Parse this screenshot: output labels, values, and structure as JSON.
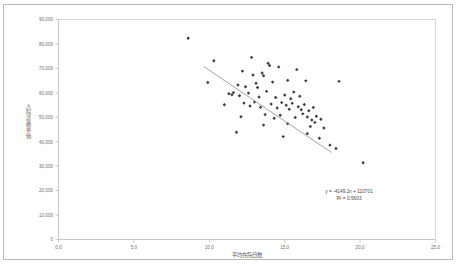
{
  "chart_data": {
    "type": "scatter",
    "title": "",
    "xlabel": "平均在院日数",
    "ylabel": "入院診療単価",
    "xlim": [
      0.0,
      25.0
    ],
    "ylim": [
      0,
      90000
    ],
    "xticks": [
      "0.0",
      "5.0",
      "10.0",
      "15.0",
      "20.0",
      "25.0"
    ],
    "xtick_values": [
      0.0,
      5.0,
      10.0,
      15.0,
      20.0,
      25.0
    ],
    "yticks": [
      "0",
      "10,000",
      "20,000",
      "30,000",
      "40,000",
      "50,000",
      "60,000",
      "70,000",
      "80,000",
      "90,000"
    ],
    "ytick_values": [
      0,
      10000,
      20000,
      30000,
      40000,
      50000,
      60000,
      70000,
      80000,
      90000
    ],
    "grid": false,
    "legend": "none",
    "marker_color": "#3a3a4a",
    "trendline_color": "#8e8e8e",
    "annotations": [
      "y = -4149.2x + 110701",
      "R² = 0.5603"
    ],
    "trendline": {
      "slope": -4149.2,
      "intercept": 110701,
      "r_squared": 0.5603,
      "x_start": 9.6,
      "x_end": 18.1
    },
    "points": [
      {
        "x": 8.6,
        "y": 82300
      },
      {
        "x": 10.3,
        "y": 73100
      },
      {
        "x": 12.8,
        "y": 74500
      },
      {
        "x": 13.9,
        "y": 72100
      },
      {
        "x": 14.0,
        "y": 71200
      },
      {
        "x": 14.6,
        "y": 70600
      },
      {
        "x": 9.9,
        "y": 64200
      },
      {
        "x": 12.2,
        "y": 68900
      },
      {
        "x": 12.9,
        "y": 67300
      },
      {
        "x": 13.5,
        "y": 68100
      },
      {
        "x": 13.6,
        "y": 67000
      },
      {
        "x": 15.8,
        "y": 69500
      },
      {
        "x": 16.4,
        "y": 64900
      },
      {
        "x": 11.9,
        "y": 63200
      },
      {
        "x": 12.4,
        "y": 62500
      },
      {
        "x": 13.1,
        "y": 63900
      },
      {
        "x": 13.2,
        "y": 62200
      },
      {
        "x": 14.2,
        "y": 64400
      },
      {
        "x": 15.2,
        "y": 65100
      },
      {
        "x": 18.6,
        "y": 64700
      },
      {
        "x": 11.3,
        "y": 59600
      },
      {
        "x": 11.5,
        "y": 59200
      },
      {
        "x": 11.6,
        "y": 60100
      },
      {
        "x": 12.0,
        "y": 58800
      },
      {
        "x": 12.6,
        "y": 59900
      },
      {
        "x": 13.3,
        "y": 58300
      },
      {
        "x": 13.8,
        "y": 60600
      },
      {
        "x": 14.4,
        "y": 58100
      },
      {
        "x": 15.0,
        "y": 59100
      },
      {
        "x": 15.4,
        "y": 57600
      },
      {
        "x": 15.6,
        "y": 60300
      },
      {
        "x": 16.0,
        "y": 58600
      },
      {
        "x": 11.0,
        "y": 55100
      },
      {
        "x": 12.3,
        "y": 55800
      },
      {
        "x": 12.7,
        "y": 54600
      },
      {
        "x": 13.0,
        "y": 56200
      },
      {
        "x": 13.4,
        "y": 54100
      },
      {
        "x": 14.1,
        "y": 55400
      },
      {
        "x": 14.5,
        "y": 53800
      },
      {
        "x": 14.8,
        "y": 56000
      },
      {
        "x": 15.1,
        "y": 54900
      },
      {
        "x": 15.3,
        "y": 53300
      },
      {
        "x": 15.5,
        "y": 55700
      },
      {
        "x": 15.9,
        "y": 54300
      },
      {
        "x": 16.1,
        "y": 53100
      },
      {
        "x": 16.3,
        "y": 55200
      },
      {
        "x": 16.6,
        "y": 52700
      },
      {
        "x": 16.9,
        "y": 54000
      },
      {
        "x": 12.1,
        "y": 50200
      },
      {
        "x": 13.7,
        "y": 51100
      },
      {
        "x": 14.3,
        "y": 49600
      },
      {
        "x": 14.7,
        "y": 50800
      },
      {
        "x": 15.7,
        "y": 49900
      },
      {
        "x": 16.2,
        "y": 51400
      },
      {
        "x": 16.5,
        "y": 50100
      },
      {
        "x": 16.8,
        "y": 48900
      },
      {
        "x": 17.1,
        "y": 50400
      },
      {
        "x": 17.4,
        "y": 49200
      },
      {
        "x": 13.6,
        "y": 46800
      },
      {
        "x": 15.2,
        "y": 47400
      },
      {
        "x": 16.7,
        "y": 46200
      },
      {
        "x": 17.0,
        "y": 47900
      },
      {
        "x": 17.6,
        "y": 45600
      },
      {
        "x": 11.8,
        "y": 43900
      },
      {
        "x": 14.9,
        "y": 42100
      },
      {
        "x": 16.5,
        "y": 43300
      },
      {
        "x": 17.3,
        "y": 41400
      },
      {
        "x": 18.0,
        "y": 38600
      },
      {
        "x": 18.4,
        "y": 37200
      },
      {
        "x": 20.2,
        "y": 31400
      }
    ]
  }
}
